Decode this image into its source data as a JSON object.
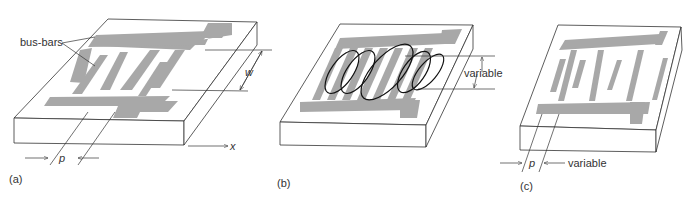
{
  "figure": {
    "panels": [
      {
        "id": "a",
        "caption": "(a)",
        "labels": {
          "bus_bars": "bus-bars",
          "width": "w",
          "period": "p",
          "axis": "x"
        }
      },
      {
        "id": "b",
        "caption": "(b)",
        "labels": {
          "overlap": "variable"
        }
      },
      {
        "id": "c",
        "caption": "(c)",
        "labels": {
          "period": "p",
          "spacing": "variable"
        }
      }
    ],
    "colors": {
      "electrode": "#a8a8a8",
      "substrate": "#ffffff",
      "line": "#333333"
    }
  }
}
